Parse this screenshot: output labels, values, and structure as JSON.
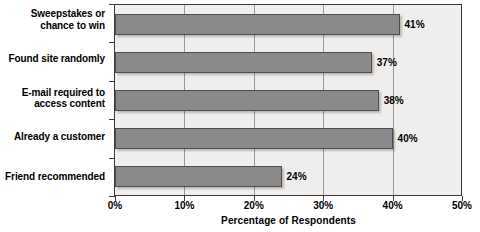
{
  "chart_data": {
    "type": "bar",
    "orientation": "horizontal",
    "title": "",
    "xlabel": "Percentage of Respondents",
    "ylabel": "",
    "xlim": [
      0,
      50
    ],
    "grid": true,
    "legend": false,
    "categories": [
      "Sweepstakes or chance to win",
      "Found site randomly",
      "E-mail required to access content",
      "Already a customer",
      "Friend recommended"
    ],
    "values": [
      41,
      37,
      38,
      40,
      24
    ],
    "value_labels": [
      "41%",
      "37%",
      "38%",
      "40%",
      "24%"
    ],
    "xticks": [
      0,
      10,
      20,
      30,
      40,
      50
    ],
    "xtick_labels": [
      "0%",
      "10%",
      "20%",
      "30%",
      "40%",
      "50%"
    ],
    "bar_color": "#8a8a8a",
    "bar_border_color": "#4e4e4e",
    "plot_background": "#efeeec",
    "gridline_color": "#9a9a9a",
    "axis_color": "#3a3a3a"
  },
  "category_lines": [
    [
      "Sweepstakes or",
      "chance to win"
    ],
    [
      "Found site randomly"
    ],
    [
      "E-mail required to",
      "access content"
    ],
    [
      "Already a customer"
    ],
    [
      "Friend recommended"
    ]
  ],
  "axis": {
    "x_title": "Percentage of Respondents"
  }
}
